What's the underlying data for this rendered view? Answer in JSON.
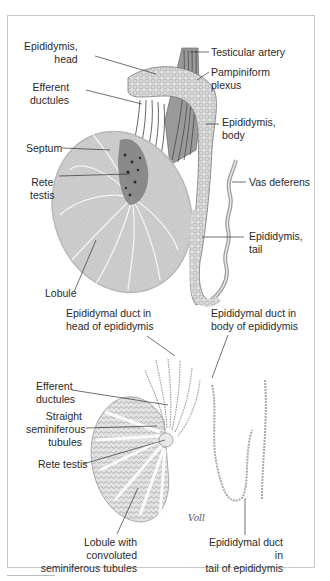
{
  "figure": {
    "top_panel": {
      "name": "Testis and epididymis (gross anatomy)",
      "labels": {
        "epididymis_head": "Epididymis,\nhead",
        "efferent_ductules": "Efferent\nductules",
        "septum": "Septum",
        "rete_testis": "Rete\ntestis",
        "lobule": "Lobule",
        "testicular_artery": "Testicular artery",
        "pampiniform_plexus": "Pampiniform\nplexus",
        "epididymis_body": "Epididymis,\nbody",
        "vas_deferens": "Vas deferens",
        "epididymis_tail": "Epididymis,\ntail"
      }
    },
    "bottom_panel": {
      "name": "Duct system of testis and epididymis",
      "labels": {
        "duct_head": "Epididymal duct in\nhead of epididymis",
        "duct_body": "Epididymal duct in\nbody of epididymis",
        "efferent_ductules": "Efferent\nductules",
        "straight_tubules": "Straight\nseminiferous\ntubules",
        "rete_testis": "Rete testis",
        "lobule_convoluted": "Lobule with convoluted\nseminiferous tubules",
        "duct_tail": "Epididymal duct in\ntail of epididymis"
      },
      "signature": "Voll"
    },
    "colors": {
      "border": "#c8c8c8",
      "testis_fill": "#c9c9c9",
      "septa": "#f2f2f2",
      "leader": "#333333",
      "label_text": "#2a2a2a"
    }
  }
}
